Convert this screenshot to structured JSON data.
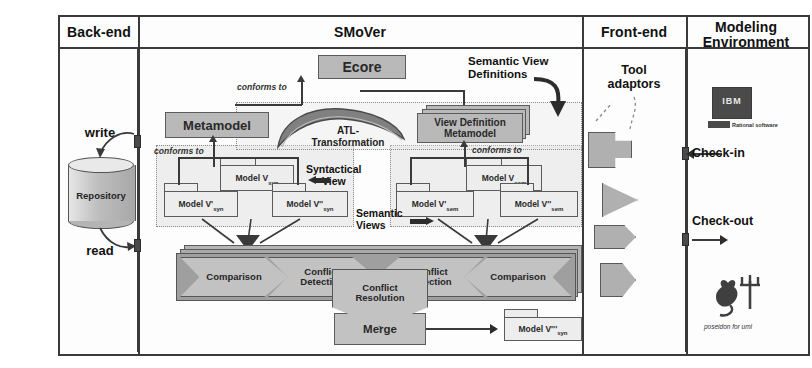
{
  "diagram": {
    "columns": [
      {
        "id": "backend",
        "label": "Back-end"
      },
      {
        "id": "smover",
        "label": "SMoVer"
      },
      {
        "id": "frontend",
        "label": "Front-end"
      },
      {
        "id": "modeling",
        "label_line1": "Modeling",
        "label_line2": "Environment"
      }
    ]
  },
  "backend": {
    "write_label": "write",
    "read_label": "read",
    "repository_label": "Repository"
  },
  "smover": {
    "ecore_label": "Ecore",
    "metamodel_label": "Metamodel",
    "view_definition_metamodel_line1": "View Definition",
    "view_definition_metamodel_line2": "Metamodel",
    "atl_line1": "ATL-",
    "atl_line2": "Transformation",
    "semantic_view_definitions_line1": "Semantic View",
    "semantic_view_definitions_line2": "Definitions",
    "conforms_to_left": "conforms to",
    "conforms_to_metamodel": "conforms to",
    "conforms_to_right": "conforms to",
    "syntactical_view_line1": "Syntactical",
    "syntactical_view_line2": "View",
    "semantic_views_line1": "Semantic",
    "semantic_views_line2": "Views",
    "syntactic_models": [
      {
        "name": "Model V'",
        "sub": "syn"
      },
      {
        "name": "Model V",
        "sub": "syn"
      },
      {
        "name": "Model V''",
        "sub": "syn"
      }
    ],
    "semantic_models": [
      {
        "name": "Model V'",
        "sub": "sem"
      },
      {
        "name": "Model V",
        "sub": "sem"
      },
      {
        "name": "Model V''",
        "sub": "sem"
      }
    ],
    "process_band": [
      {
        "id": "comparison-left",
        "line1": "Comparison",
        "line2": ""
      },
      {
        "id": "conflict-detection-left",
        "line1": "Conflict",
        "line2": "Detection"
      },
      {
        "id": "conflict-detection-right",
        "line1": "Conflict",
        "line2": "Detection"
      },
      {
        "id": "comparison-right",
        "line1": "Comparison",
        "line2": ""
      }
    ],
    "conflict_resolution_line1": "Conflict",
    "conflict_resolution_line2": "Resolution",
    "merge_label": "Merge",
    "result_model": {
      "name": "Model V'''",
      "sub": "syn"
    }
  },
  "frontend": {
    "tool_adaptors_line1": "Tool",
    "tool_adaptors_line2": "adaptors",
    "adaptor_shapes": [
      "plug-shape",
      "triangle-shape",
      "tag-shape",
      "d-shape"
    ]
  },
  "modeling": {
    "checkin_label": "Check-in",
    "checkout_label": "Check-out",
    "ibm_logo_text": "IBM",
    "rational_logo_caption": "Rational software",
    "poseidon_caption": "poseidon for uml"
  },
  "colors": {
    "frame_stroke": "#3a3a3a",
    "box_fill": "#b9b9b9",
    "white_box_fill": "#ededed",
    "band_fill": "#9f9f9f",
    "chevron_fill": "#c2c2c2",
    "group_fill": "#e2e2e2"
  }
}
